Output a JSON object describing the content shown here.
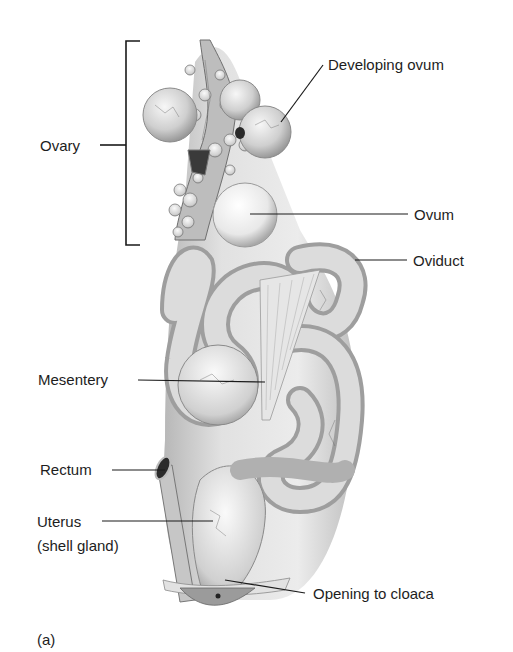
{
  "figure": {
    "panel_label": "(a)",
    "labels": {
      "ovary": "Ovary",
      "developing_ovum": "Developing ovum",
      "ovum": "Ovum",
      "oviduct": "Oviduct",
      "mesentery": "Mesentery",
      "rectum": "Rectum",
      "uterus_line1": "Uterus",
      "uterus_line2": "(shell gland)",
      "opening_to_cloaca": "Opening to cloaca"
    },
    "colors": {
      "background": "#ffffff",
      "tissue": "#d9d9d9",
      "tissue_shadow": "#8a8a8a",
      "leader_line": "#1a1a1a"
    }
  }
}
